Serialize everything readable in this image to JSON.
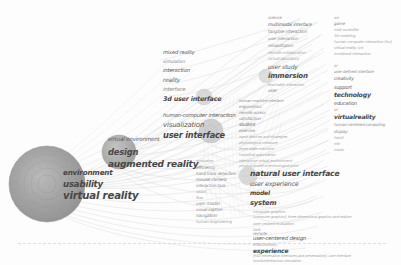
{
  "meta": {
    "width": 401,
    "height": 265,
    "background": "#fdfdfd"
  },
  "palette": {
    "cluster_core": "#8f8f8f",
    "cluster_mid": "#9e9e9e",
    "cluster_outer": "#b4b4b4",
    "edge": "#c9c9c9",
    "label_dark": "#474747",
    "label_mid": "#5d5d5d",
    "label_light": "#8d8d8d",
    "label_faint": "#a6a6a6",
    "baseline": "#d8d8d8"
  },
  "nodes": [
    {
      "label": "virtual reality",
      "x": 47,
      "y": 184,
      "r": 38,
      "weight": 100
    },
    {
      "label": "usability",
      "x": 47,
      "y": 184,
      "r": 28,
      "weight": 72
    },
    {
      "label": "environment",
      "x": 47,
      "y": 184,
      "r": 18,
      "weight": 45
    },
    {
      "label": "augmented reality",
      "x": 120,
      "y": 152,
      "r": 17,
      "weight": 40
    },
    {
      "label": "user interface",
      "x": 213,
      "y": 131,
      "r": 12,
      "weight": 30
    },
    {
      "label": "3d user interface",
      "x": 205,
      "y": 96,
      "r": 9,
      "weight": 22
    }
  ],
  "labels": {
    "cluster_main": [
      {
        "t": "environment",
        "x": 63,
        "y": 173,
        "s": 7.2,
        "w": "b",
        "c": "mid"
      },
      {
        "t": "usability",
        "x": 63,
        "y": 184,
        "s": 8.6,
        "w": "b",
        "c": "dark"
      },
      {
        "t": "virtual reality",
        "x": 63,
        "y": 196,
        "s": 10.2,
        "w": "b",
        "c": "dark"
      }
    ],
    "cluster_design": [
      {
        "t": "virtual environment",
        "x": 108,
        "y": 140,
        "s": 5.6,
        "w": "n",
        "c": "mid"
      },
      {
        "t": "design",
        "x": 108,
        "y": 152,
        "s": 8.4,
        "w": "b",
        "c": "dark"
      },
      {
        "t": "augmented reality",
        "x": 108,
        "y": 164,
        "s": 9.0,
        "w": "b",
        "c": "dark"
      }
    ],
    "cluster_interface": [
      {
        "t": "mixed reality",
        "x": 163,
        "y": 53,
        "s": 5.2,
        "w": "n",
        "c": "mid"
      },
      {
        "t": "simulation",
        "x": 163,
        "y": 62,
        "s": 4.6,
        "w": "n",
        "c": "light"
      },
      {
        "t": "interaction",
        "x": 163,
        "y": 71,
        "s": 5.4,
        "w": "n",
        "c": "mid"
      },
      {
        "t": "reality",
        "x": 163,
        "y": 81,
        "s": 5.8,
        "w": "n",
        "c": "mid"
      },
      {
        "t": "interface",
        "x": 163,
        "y": 90,
        "s": 5.4,
        "w": "n",
        "c": "light"
      },
      {
        "t": "3d user interface",
        "x": 163,
        "y": 99,
        "s": 6.4,
        "w": "b",
        "c": "dark"
      },
      {
        "t": "human-computer interaction",
        "x": 163,
        "y": 116,
        "s": 5.4,
        "w": "n",
        "c": "mid"
      },
      {
        "t": "visualization",
        "x": 163,
        "y": 125,
        "s": 7.0,
        "w": "n",
        "c": "mid"
      },
      {
        "t": "user interface",
        "x": 163,
        "y": 135,
        "s": 8.2,
        "w": "b",
        "c": "dark"
      }
    ],
    "column_center": [
      {
        "t": "motivation",
        "x": 196,
        "y": 162,
        "s": 3.6,
        "w": "n",
        "c": "faint"
      },
      {
        "t": "efficiency",
        "x": 196,
        "y": 168,
        "s": 4.4,
        "w": "n",
        "c": "light"
      },
      {
        "t": "hand track detection",
        "x": 196,
        "y": 174,
        "s": 4.2,
        "w": "n",
        "c": "light"
      },
      {
        "t": "mouse camera",
        "x": 196,
        "y": 180,
        "s": 4.4,
        "w": "n",
        "c": "light"
      },
      {
        "t": "interaction task",
        "x": 196,
        "y": 186,
        "s": 4.2,
        "w": "n",
        "c": "light"
      },
      {
        "t": "vision",
        "x": 196,
        "y": 192,
        "s": 4.0,
        "w": "n",
        "c": "faint"
      },
      {
        "t": "flow",
        "x": 196,
        "y": 198,
        "s": 3.8,
        "w": "n",
        "c": "faint"
      },
      {
        "t": "user model",
        "x": 196,
        "y": 204,
        "s": 4.6,
        "w": "n",
        "c": "light"
      },
      {
        "t": "visual caption",
        "x": 196,
        "y": 210,
        "s": 4.2,
        "w": "n",
        "c": "light"
      },
      {
        "t": "navigation",
        "x": 196,
        "y": 216,
        "s": 4.4,
        "w": "n",
        "c": "light"
      },
      {
        "t": "human engineering",
        "x": 196,
        "y": 222,
        "s": 4.0,
        "w": "n",
        "c": "faint"
      }
    ],
    "column_dense": [
      {
        "t": "human-machine interface",
        "x": 239,
        "y": 101,
        "s": 3.8,
        "w": "n",
        "c": "light"
      },
      {
        "t": "ergonomics",
        "x": 239,
        "y": 107,
        "s": 4.2,
        "w": "n",
        "c": "light"
      },
      {
        "t": "remote access",
        "x": 239,
        "y": 113,
        "s": 4.0,
        "w": "n",
        "c": "light"
      },
      {
        "t": "satisfaction",
        "x": 239,
        "y": 119,
        "s": 4.2,
        "w": "n",
        "c": "light"
      },
      {
        "t": "student",
        "x": 239,
        "y": 125,
        "s": 4.6,
        "w": "n",
        "c": "mid"
      },
      {
        "t": "exercise",
        "x": 239,
        "y": 131,
        "s": 4.2,
        "w": "n",
        "c": "light"
      },
      {
        "t": "input devices and strategies",
        "x": 239,
        "y": 137,
        "s": 3.8,
        "w": "n",
        "c": "faint"
      },
      {
        "t": "physiological measure",
        "x": 239,
        "y": 143,
        "s": 3.8,
        "w": "n",
        "c": "faint"
      },
      {
        "t": "three state machine",
        "x": 239,
        "y": 149,
        "s": 3.8,
        "w": "n",
        "c": "faint"
      },
      {
        "t": "industrial automation",
        "x": 239,
        "y": 155,
        "s": 3.8,
        "w": "n",
        "c": "faint"
      },
      {
        "t": "interactive virtual environment",
        "x": 239,
        "y": 161,
        "s": 3.8,
        "w": "n",
        "c": "faint"
      },
      {
        "t": "physical model of technological price",
        "x": 239,
        "y": 167,
        "s": 3.6,
        "w": "n",
        "c": "faint"
      }
    ],
    "cluster_nui": [
      {
        "t": "natural user interface",
        "x": 250,
        "y": 174,
        "s": 7.6,
        "w": "b",
        "c": "dark"
      },
      {
        "t": "user experience",
        "x": 250,
        "y": 184,
        "s": 6.4,
        "w": "n",
        "c": "mid"
      },
      {
        "t": "model",
        "x": 250,
        "y": 193,
        "s": 6.0,
        "w": "b",
        "c": "dark"
      },
      {
        "t": "system",
        "x": 250,
        "y": 203,
        "s": 6.8,
        "w": "b",
        "c": "dark"
      }
    ],
    "block_bottom": [
      {
        "t": "computer graphics",
        "x": 253,
        "y": 212,
        "s": 3.8,
        "w": "n",
        "c": "faint"
      },
      {
        "t": "[computer graphics]: three dimensional graphics and realism",
        "x": 253,
        "y": 218,
        "s": 3.6,
        "w": "n",
        "c": "faint"
      },
      {
        "t": "user centred evaluation",
        "x": 253,
        "y": 224,
        "s": 3.8,
        "w": "n",
        "c": "faint"
      },
      {
        "t": "task",
        "x": 253,
        "y": 230,
        "s": 4.0,
        "w": "n",
        "c": "faint"
      },
      {
        "t": "remote",
        "x": 253,
        "y": 234,
        "s": 4.2,
        "w": "n",
        "c": "light"
      },
      {
        "t": "user-centered design",
        "x": 253,
        "y": 239,
        "s": 5.4,
        "w": "n",
        "c": "mid"
      },
      {
        "t": "effectiveness",
        "x": 253,
        "y": 245,
        "s": 4.0,
        "w": "n",
        "c": "faint"
      },
      {
        "t": "experience",
        "x": 253,
        "y": 251,
        "s": 6.0,
        "w": "b",
        "c": "dark"
      },
      {
        "t": "[h52 information interfaces and presentation]: user interface",
        "x": 253,
        "y": 257,
        "s": 3.6,
        "w": "n",
        "c": "faint"
      },
      {
        "t": "function/behaviour simulation",
        "x": 253,
        "y": 262,
        "s": 3.6,
        "w": "n",
        "c": "faint"
      }
    ],
    "column_right_inner": [
      {
        "t": "science",
        "x": 268,
        "y": 18,
        "s": 4.0,
        "w": "n",
        "c": "light"
      },
      {
        "t": "multimodal interface",
        "x": 268,
        "y": 25,
        "s": 4.6,
        "w": "n",
        "c": "mid"
      },
      {
        "t": "tangible interaction",
        "x": 268,
        "y": 32,
        "s": 4.4,
        "w": "n",
        "c": "light"
      },
      {
        "t": "user interaction",
        "x": 268,
        "y": 39,
        "s": 4.2,
        "w": "n",
        "c": "light"
      },
      {
        "t": "rehabilitation",
        "x": 268,
        "y": 46,
        "s": 4.2,
        "w": "n",
        "c": "light"
      },
      {
        "t": "remote collaboration",
        "x": 268,
        "y": 53,
        "s": 4.0,
        "w": "n",
        "c": "faint"
      },
      {
        "t": "virtual laboratory",
        "x": 268,
        "y": 59,
        "s": 4.0,
        "w": "n",
        "c": "faint"
      },
      {
        "t": "user study",
        "x": 268,
        "y": 67,
        "s": 6.0,
        "w": "n",
        "c": "mid"
      },
      {
        "t": "immersion",
        "x": 268,
        "y": 76,
        "s": 7.0,
        "w": "b",
        "c": "dark"
      },
      {
        "t": "teachable interaction",
        "x": 268,
        "y": 85,
        "s": 3.8,
        "w": "n",
        "c": "faint"
      },
      {
        "t": "user",
        "x": 268,
        "y": 91,
        "s": 4.4,
        "w": "n",
        "c": "light"
      }
    ],
    "column_right_outer": [
      {
        "t": "art",
        "x": 334,
        "y": 18,
        "s": 3.8,
        "w": "n",
        "c": "faint"
      },
      {
        "t": "game",
        "x": 334,
        "y": 24,
        "s": 4.2,
        "w": "n",
        "c": "light"
      },
      {
        "t": "midi controller",
        "x": 334,
        "y": 30,
        "s": 3.8,
        "w": "n",
        "c": "faint"
      },
      {
        "t": "3d modeling",
        "x": 334,
        "y": 36,
        "s": 3.8,
        "w": "n",
        "c": "faint"
      },
      {
        "t": "human computer interaction (hci)",
        "x": 334,
        "y": 42,
        "s": 3.8,
        "w": "n",
        "c": "faint"
      },
      {
        "t": "virtual reality (vr)",
        "x": 334,
        "y": 48,
        "s": 3.8,
        "w": "n",
        "c": "faint"
      },
      {
        "t": "emotional interaction",
        "x": 334,
        "y": 54,
        "s": 3.8,
        "w": "n",
        "c": "faint"
      },
      {
        "t": "ar",
        "x": 334,
        "y": 66,
        "s": 4.0,
        "w": "n",
        "c": "faint"
      },
      {
        "t": "user defined interface",
        "x": 334,
        "y": 72,
        "s": 4.0,
        "w": "n",
        "c": "light"
      },
      {
        "t": "creativity",
        "x": 334,
        "y": 79,
        "s": 4.6,
        "w": "n",
        "c": "mid"
      },
      {
        "t": "support",
        "x": 334,
        "y": 87,
        "s": 5.0,
        "w": "n",
        "c": "mid"
      },
      {
        "t": "technology",
        "x": 334,
        "y": 95,
        "s": 6.2,
        "w": "b",
        "c": "dark"
      },
      {
        "t": "education",
        "x": 334,
        "y": 103,
        "s": 5.0,
        "w": "n",
        "c": "mid"
      },
      {
        "t": "vr",
        "x": 334,
        "y": 110,
        "s": 4.2,
        "w": "n",
        "c": "light"
      },
      {
        "t": "virtualreality",
        "x": 334,
        "y": 117,
        "s": 6.0,
        "w": "b",
        "c": "dark"
      },
      {
        "t": "human-centered computing",
        "x": 334,
        "y": 125,
        "s": 4.0,
        "w": "n",
        "c": "light"
      },
      {
        "t": "display",
        "x": 334,
        "y": 132,
        "s": 4.2,
        "w": "n",
        "c": "light"
      },
      {
        "t": "hand",
        "x": 334,
        "y": 138,
        "s": 4.0,
        "w": "n",
        "c": "faint"
      },
      {
        "t": "risk",
        "x": 334,
        "y": 144,
        "s": 3.8,
        "w": "n",
        "c": "faint"
      },
      {
        "t": "music",
        "x": 334,
        "y": 150,
        "s": 3.8,
        "w": "n",
        "c": "faint"
      }
    ]
  },
  "chart_data": {
    "type": "scatter",
    "xlabel": "",
    "ylabel": "",
    "legend": "none",
    "grid": false,
    "note": "Bubble-size network map: node area encodes term frequency; curved links encode co-occurrence."
  }
}
